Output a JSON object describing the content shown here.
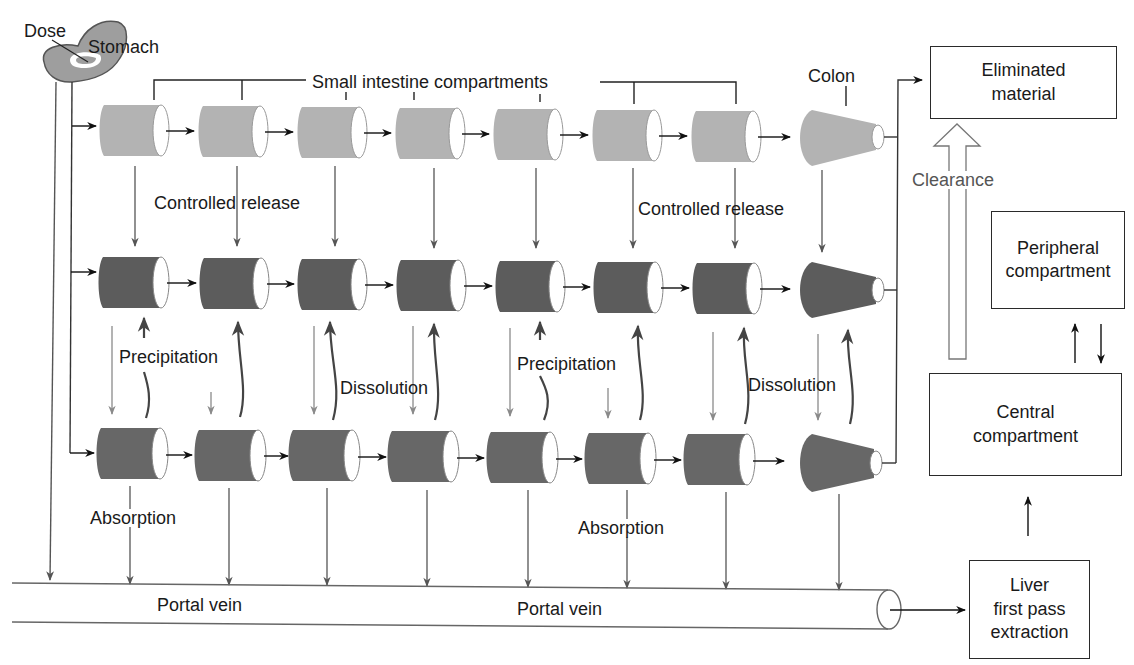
{
  "diagram": {
    "colors": {
      "undissolved": "#b3b3b3",
      "released": "#5c5c5c",
      "dissolved": "#676767",
      "line": "#555555",
      "arrow_black": "#111111"
    },
    "labels": {
      "dose": "Dose",
      "stomach": "Stomach",
      "small_intestine": "Small intestine compartments",
      "colon": "Colon",
      "controlled_release_1": "Controlled release",
      "controlled_release_2": "Controlled release",
      "precipitation_1": "Precipitation",
      "precipitation_2": "Precipitation",
      "dissolution_1": "Dissolution",
      "dissolution_2": "Dissolution",
      "absorption_1": "Absorption",
      "absorption_2": "Absorption",
      "portal_vein_1": "Portal vein",
      "portal_vein_2": "Portal vein",
      "clearance": "Clearance"
    },
    "boxes": {
      "eliminated": "Eliminated\nmaterial",
      "peripheral": "Peripheral\ncompartment",
      "central": "Central\ncompartment",
      "liver": "Liver\nfirst pass\nextraction"
    },
    "rows": [
      {
        "name": "undissolved-row",
        "compartments": 7,
        "has_colon": true
      },
      {
        "name": "released-row",
        "compartments": 7,
        "has_colon": true
      },
      {
        "name": "dissolved-row",
        "compartments": 7,
        "has_colon": true
      }
    ]
  }
}
